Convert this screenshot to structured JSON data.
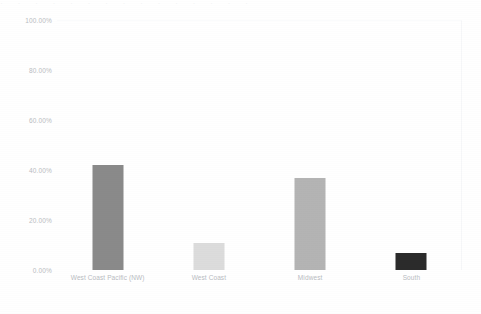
{
  "chart_data": {
    "type": "bar",
    "title": "",
    "subtitle": "",
    "xlabel": "",
    "ylabel": "",
    "categories": [
      "West Coast Pacific (NW)",
      "West Coast",
      "Midwest",
      "South"
    ],
    "values": [
      42.0,
      11.0,
      37.0,
      7.0
    ],
    "value_labels": [
      "42.00%",
      "11.00%",
      "37.00%",
      "7.00%"
    ],
    "series": [
      {
        "name": "",
        "values": [
          42.0,
          11.0,
          37.0,
          7.0
        ]
      }
    ],
    "ylim": [
      0,
      100
    ],
    "ytick_values": [
      100,
      80,
      60,
      40,
      20,
      0
    ],
    "ytick_labels": [
      "100.00%",
      "80.00%",
      "60.00%",
      "40.00%",
      "20.00%",
      "0.00%"
    ],
    "xtick_labels": [
      "West Coast Pacific (NW)",
      "West Coast",
      "Midwest",
      "South"
    ],
    "grid": false,
    "legend": false,
    "legend_position": "none",
    "annotations": [],
    "bar_colors": [
      "#8a8a8a",
      "#dcdcdc",
      "#b4b4b4",
      "#2b2b2b"
    ],
    "background_color": "#ffffff",
    "axis_label_color": "#b9bcc2",
    "plot_border_color": "#f6f7f9"
  },
  "artifact": {
    "top_strip_text": "· · · · · · · · · · · · · · ·"
  }
}
